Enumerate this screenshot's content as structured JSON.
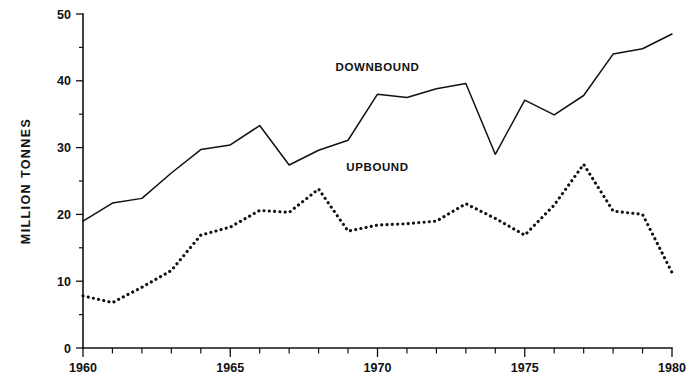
{
  "chart_data": {
    "type": "line",
    "title": "",
    "xlabel": "",
    "ylabel": "MILLION  TONNES",
    "xlim": [
      1960,
      1980
    ],
    "ylim": [
      0,
      50
    ],
    "grid": false,
    "legend_position": "inline-annotations",
    "x": [
      1960,
      1961,
      1962,
      1963,
      1964,
      1965,
      1966,
      1967,
      1968,
      1969,
      1970,
      1971,
      1972,
      1973,
      1974,
      1975,
      1976,
      1977,
      1978,
      1979,
      1980
    ],
    "y_ticks": [
      0,
      10,
      20,
      30,
      40,
      50
    ],
    "y_minor_ticks": [
      5,
      15,
      25,
      35,
      45
    ],
    "y_tick_labels": [
      "0",
      "10",
      "20",
      "30",
      "40",
      "50"
    ],
    "x_ticks": [
      1960,
      1961,
      1962,
      1963,
      1964,
      1965,
      1966,
      1967,
      1968,
      1969,
      1970,
      1971,
      1972,
      1973,
      1974,
      1975,
      1976,
      1977,
      1978,
      1979,
      1980
    ],
    "x_labeled_ticks": [
      1960,
      1965,
      1970,
      1975,
      1980
    ],
    "x_tick_labels": [
      "1960",
      "1965",
      "1970",
      "1975",
      "1980"
    ],
    "series": [
      {
        "name": "DOWNBOUND",
        "style": "solid",
        "label_x": 1970.0,
        "label_y": 41.5,
        "values": [
          19.0,
          21.7,
          22.4,
          26.2,
          29.7,
          30.4,
          33.3,
          27.4,
          29.6,
          31.1,
          38.0,
          37.5,
          38.8,
          39.6,
          29.0,
          37.1,
          34.9,
          37.8,
          44.0,
          44.8,
          47.0
        ]
      },
      {
        "name": "UPBOUND",
        "style": "dotted",
        "label_x": 1970.0,
        "label_y": 26.5,
        "values": [
          7.8,
          6.8,
          9.1,
          11.6,
          16.9,
          18.1,
          20.6,
          20.3,
          23.8,
          17.5,
          18.4,
          18.6,
          19.0,
          21.6,
          19.4,
          16.9,
          21.4,
          27.5,
          20.5,
          20.0,
          11.3
        ]
      }
    ]
  }
}
